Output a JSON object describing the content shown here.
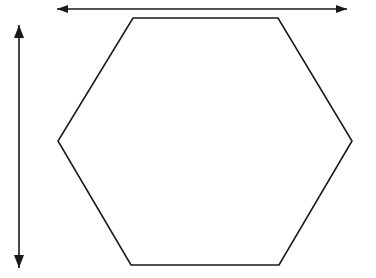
{
  "figure": {
    "background_color": "#ffffff",
    "ink_color": "#1a1a1a",
    "canvas": {
      "width": 376,
      "height": 278
    }
  },
  "shapes": {
    "hexagon": {
      "name": "hexagon",
      "sides": 6,
      "orientation": "flat-top",
      "stroke_color": "#1a1a1a",
      "stroke_width": 1.6,
      "fill": "none",
      "vertices": [
        {
          "label": "top-left",
          "x": 133,
          "y": 18
        },
        {
          "label": "top-right",
          "x": 278,
          "y": 18
        },
        {
          "label": "right",
          "x": 352,
          "y": 141
        },
        {
          "label": "bottom-right",
          "x": 279,
          "y": 265
        },
        {
          "label": "bottom-left",
          "x": 131,
          "y": 265
        },
        {
          "label": "left",
          "x": 58,
          "y": 141
        }
      ],
      "points_attr": "133,18 278,18 352,141 279,265 131,265 58,141"
    }
  },
  "annotations": {
    "width_arrow": {
      "name": "width-dimension-arrow",
      "orientation": "horizontal",
      "double_headed": true,
      "stroke_color": "#1a1a1a",
      "stroke_width": 1.6,
      "shaft": {
        "x1": 57,
        "y1": 9,
        "x2": 347,
        "y2": 9
      },
      "head_start": "57,9 68,5 68,13",
      "head_end": "347,9 336,5 336,13",
      "span_px": 290
    },
    "height_arrow": {
      "name": "height-dimension-arrow",
      "orientation": "vertical",
      "double_headed": true,
      "stroke_color": "#1a1a1a",
      "stroke_width": 1.6,
      "shaft": {
        "x1": 19,
        "y1": 25,
        "x2": 19,
        "y2": 268
      },
      "head_start": "19,25 14,38 24,38",
      "head_end": "19,268 14,255 24,255",
      "span_px": 243
    }
  }
}
